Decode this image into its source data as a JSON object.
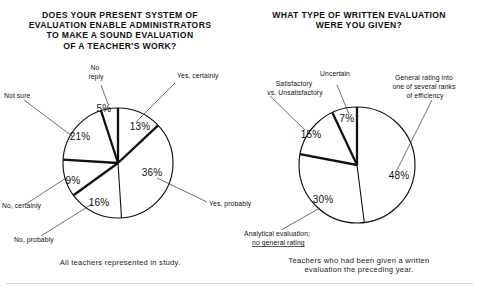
{
  "figure": {
    "background_color": "#ffffff",
    "line_color": "#111111"
  },
  "panels": {
    "left": {
      "title": "DOES YOUR PRESENT SYSTEM OF\nEVALUATION ENABLE ADMINISTRATORS\nTO MAKE A SOUND EVALUATION\nOF A TEACHER'S WORK?",
      "caption": "All teachers represented in study.",
      "labels": {
        "yes_certainly": "Yes, certainly",
        "yes_probably": "Yes, probably",
        "no_probably": "No, probably",
        "no_certainly": "No, certainly",
        "not_sure": "Not sure",
        "no_reply": "No\nreply"
      },
      "values": {
        "yes_certainly": "13%",
        "yes_probably": "36%",
        "no_probably": "16%",
        "no_certainly": "9%",
        "not_sure": "21%",
        "no_reply": "5%"
      }
    },
    "right": {
      "title": "WHAT TYPE OF WRITTEN EVALUATION\nWERE YOU GIVEN?",
      "caption": "Teachers who had been given a written\nevaluation the preceding year.",
      "labels": {
        "general_rating": "General rating into\none of several ranks\nof efficiency",
        "analytical": "Analytical evaluation;",
        "analytical_line2": "no general rating",
        "satisfactory": "Satisfactory\nvs. Unsatisfactory",
        "uncertain": "Uncertain"
      },
      "values": {
        "general_rating": "48%",
        "analytical": "30%",
        "satisfactory": "15%",
        "uncertain": "7%"
      }
    }
  },
  "chart_data": [
    {
      "type": "pie",
      "title": "DOES YOUR PRESENT SYSTEM OF EVALUATION ENABLE ADMINISTRATORS TO MAKE A SOUND EVALUATION OF A TEACHER'S WORK?",
      "subtitle": "All teachers represented in study.",
      "unit": "percent",
      "start_angle_deg": 0,
      "direction": "clockwise",
      "categories": [
        "Yes, certainly",
        "Yes, probably",
        "No, probably",
        "No, certainly",
        "Not sure",
        "No reply"
      ],
      "values": [
        13,
        36,
        16,
        9,
        21,
        5
      ],
      "labels": [
        "13%",
        "36%",
        "16%",
        "9%",
        "21%",
        "5%"
      ],
      "legend": "callout-leader-lines",
      "grid": false
    },
    {
      "type": "pie",
      "title": "WHAT TYPE OF WRITTEN EVALUATION WERE YOU GIVEN?",
      "subtitle": "Teachers who had been given a written evaluation the preceding year.",
      "unit": "percent",
      "start_angle_deg": 0,
      "direction": "clockwise",
      "categories": [
        "General rating into one of several ranks of efficiency",
        "Analytical evaluation; no general rating",
        "Satisfactory vs. Unsatisfactory",
        "Uncertain"
      ],
      "values": [
        48,
        30,
        15,
        7
      ],
      "labels": [
        "48%",
        "30%",
        "15%",
        "7%"
      ],
      "legend": "callout-leader-lines",
      "grid": false
    }
  ]
}
